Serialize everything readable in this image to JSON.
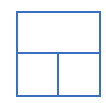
{
  "icon": {
    "name": "layout-one-top-two-bottom-icon",
    "stroke_color": "#3a6fc4",
    "background": "#ffffff",
    "panels": [
      {
        "id": "top",
        "label": ""
      },
      {
        "id": "bottom-left",
        "label": ""
      },
      {
        "id": "bottom-right",
        "label": ""
      }
    ]
  }
}
